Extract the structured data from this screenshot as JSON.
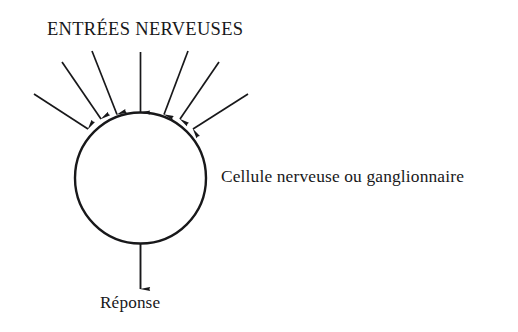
{
  "figure": {
    "kind": "neuron-schematic-diagram",
    "language": "fr",
    "background_color": "#ffffff",
    "ink_color": "#18181a",
    "title": "ENTRÉES NERVEUSES",
    "cell_label": "Cellule nerveuse ou ganglionnaire",
    "response_label": "Réponse",
    "cell_body": {
      "name": "nerve-cell-circle",
      "cx": 140.5,
      "cy": 178,
      "r": 65.5,
      "stroke_width": 2.4,
      "fill": "none"
    },
    "input_arrows": {
      "count": 7,
      "name": "nerve-input-arrow",
      "description": "arrows converging onto the top of the cell body",
      "items": [
        {
          "id": 1,
          "x1": 34,
          "y1": 94,
          "x2": 88,
          "y2": 129
        },
        {
          "id": 2,
          "x1": 62,
          "y1": 62,
          "x2": 101,
          "y2": 119
        },
        {
          "id": 3,
          "x1": 92,
          "y1": 51,
          "x2": 117,
          "y2": 114.5
        },
        {
          "id": 4,
          "x1": 140.5,
          "y1": 52,
          "x2": 140.5,
          "y2": 112.5
        },
        {
          "id": 5,
          "x1": 188,
          "y1": 51,
          "x2": 164,
          "y2": 114.5
        },
        {
          "id": 6,
          "x1": 219,
          "y1": 62,
          "x2": 180,
          "y2": 119
        },
        {
          "id": 7,
          "x1": 248,
          "y1": 94,
          "x2": 193,
          "y2": 129
        }
      ]
    },
    "output_arrow": {
      "name": "response-output-arrow",
      "x1": 140.5,
      "y1": 244,
      "x2": 140.5,
      "y2": 289
    }
  }
}
